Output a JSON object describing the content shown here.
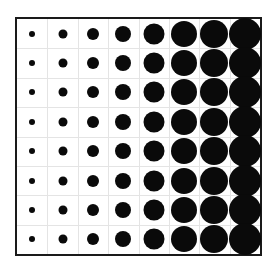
{
  "diagram": {
    "type": "dot-size-grid",
    "rows": 8,
    "columns": 8,
    "dot_color": "#0a0a0a",
    "frame_color": "#1a1a1a",
    "grid_color": "#e4e4e4",
    "column_dot_diameters_px": [
      6,
      9,
      12,
      16,
      21,
      26,
      28,
      32
    ]
  }
}
